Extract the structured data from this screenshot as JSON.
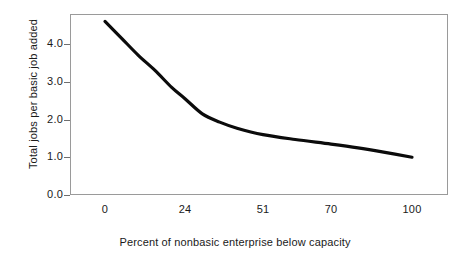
{
  "chart_data": {
    "type": "line",
    "title": "",
    "subtitle": "",
    "xlabel": "Percent of nonbasic enterprise below capacity",
    "ylabel": "Total jobs per basic job added",
    "grid": false,
    "legend": false,
    "legend_position": "none",
    "line_color": "#0b0b0b",
    "frame_color": "#9a9a9a",
    "background": "#ffffff",
    "xlim": [
      0,
      110
    ],
    "ylim": [
      0.0,
      4.8
    ],
    "xticks": [
      0,
      24,
      51,
      70,
      100
    ],
    "xtick_labels": [
      "0",
      "24",
      "51",
      "70",
      "100"
    ],
    "yticks": [
      0.0,
      1.0,
      2.0,
      3.0,
      4.0
    ],
    "ytick_labels": [
      "0.0",
      "1.0",
      "2.0",
      "3.0",
      "4.0"
    ],
    "series": [
      {
        "name": "Total jobs per basic job added",
        "x": [
          0,
          5,
          10,
          15,
          20,
          24,
          30,
          36,
          42,
          51,
          60,
          70,
          80,
          90,
          100
        ],
        "values": [
          4.6,
          4.15,
          3.7,
          3.3,
          2.85,
          2.55,
          2.15,
          1.93,
          1.77,
          1.6,
          1.47,
          1.35,
          1.25,
          1.13,
          1.0
        ]
      }
    ]
  },
  "axes": {
    "y_title": "Total jobs per basic job added",
    "x_title": "Percent of nonbasic enterprise below capacity",
    "y_labels": [
      "4.0",
      "3.0",
      "2.0",
      "1.0",
      "0.0"
    ],
    "x_labels": [
      "0",
      "24",
      "51",
      "70",
      "100"
    ]
  }
}
